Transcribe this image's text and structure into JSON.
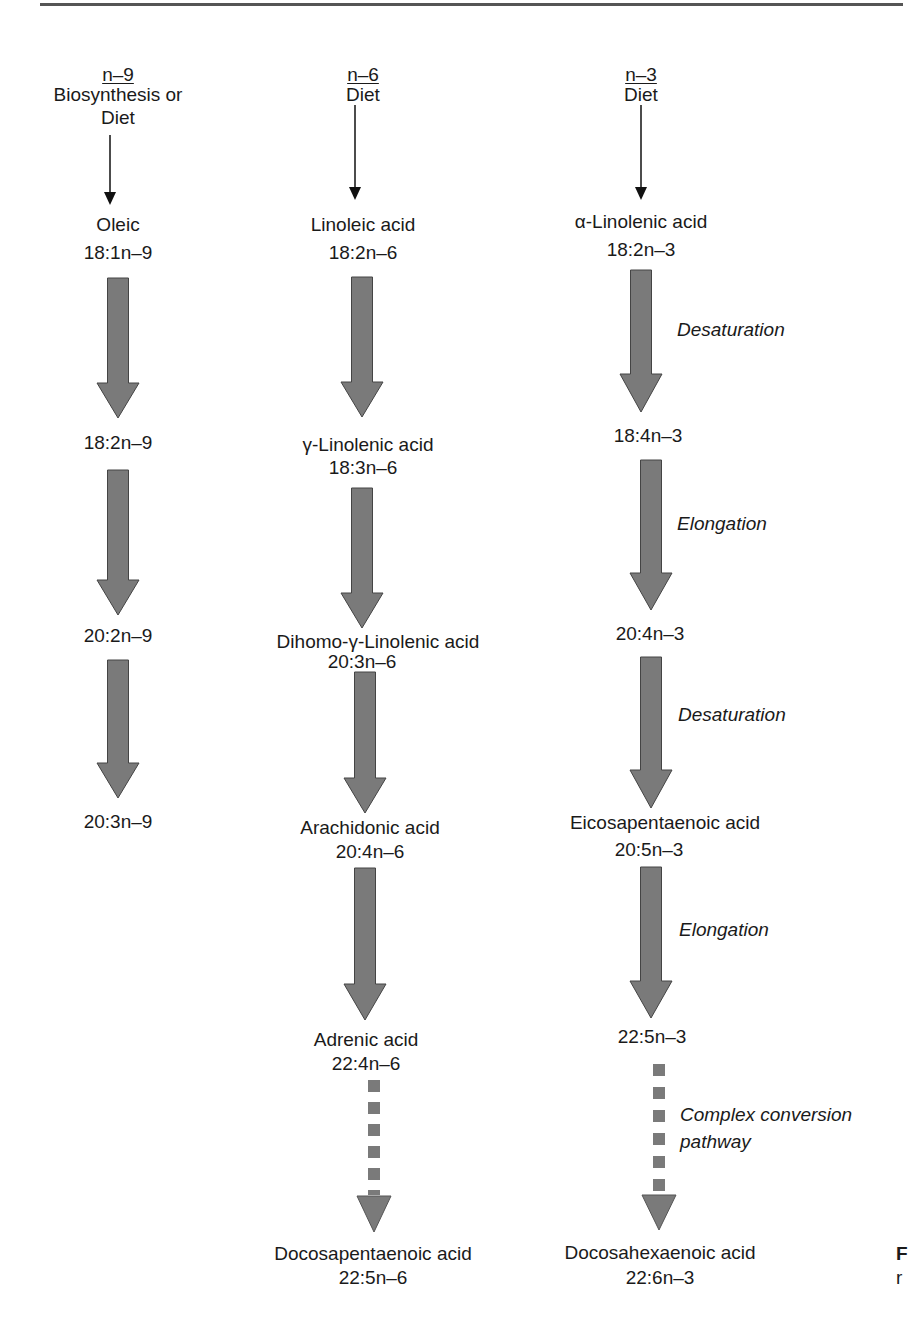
{
  "figure": {
    "columns": [
      {
        "id": "n9",
        "header": "n–9",
        "source": [
          "Biosynthesis or",
          "Diet"
        ],
        "nodes": [
          {
            "name": "Oleic",
            "formula": "18:1n–9"
          },
          {
            "name": "",
            "formula": "18:2n–9"
          },
          {
            "name": "",
            "formula": "20:2n–9"
          },
          {
            "name": "",
            "formula": "20:3n–9"
          }
        ]
      },
      {
        "id": "n6",
        "header": "n–6",
        "source": [
          "Diet"
        ],
        "nodes": [
          {
            "name": "Linoleic acid",
            "formula": "18:2n–6"
          },
          {
            "name": "γ-Linolenic acid",
            "formula": "18:3n–6"
          },
          {
            "name": "Dihomo-γ-Linolenic acid",
            "formula": "20:3n–6"
          },
          {
            "name": "Arachidonic acid",
            "formula": "20:4n–6"
          },
          {
            "name": "Adrenic acid",
            "formula": "22:4n–6"
          },
          {
            "name": "Docosapentaenoic acid",
            "formula": "22:5n–6"
          }
        ]
      },
      {
        "id": "n3",
        "header": "n–3",
        "source": [
          "Diet"
        ],
        "nodes": [
          {
            "name": "α-Linolenic acid",
            "formula": "18:2n–3"
          },
          {
            "name": "",
            "formula": "18:4n–3"
          },
          {
            "name": "",
            "formula": "20:4n–3"
          },
          {
            "name": "Eicosapentaenoic acid",
            "formula": "20:5n–3"
          },
          {
            "name": "",
            "formula": "22:5n–3"
          },
          {
            "name": "Docosahexaenoic acid",
            "formula": "22:6n–3"
          }
        ],
        "steps": [
          "Desaturation",
          "Elongation",
          "Desaturation",
          "Elongation",
          "Complex conversion",
          "pathway"
        ]
      }
    ],
    "edge_fragments": [
      "F",
      "r"
    ],
    "colors": {
      "arrow_fill": "#7a7a7a",
      "arrow_stroke": "#444444",
      "text": "#1a1a1a",
      "rule": "#555555"
    }
  }
}
